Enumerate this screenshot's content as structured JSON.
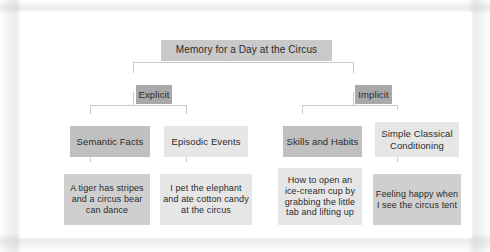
{
  "diagram": {
    "title": "Memory for a Day at the Circus",
    "type": "hierarchy-tree",
    "levels": 4,
    "colors": {
      "root_fill": "#c9c9c9",
      "branch_fill": "#a9a9a9",
      "dark_fill": "#c0c0c0",
      "light_fill": "#e6e6e6",
      "mid_fill": "#cfcfcf",
      "connector": "#c9c9c9",
      "text": "#2b2b2b",
      "panel_background": "#ffffff"
    },
    "nodes": {
      "root": {
        "label": "Memory for a Day at the Circus"
      },
      "explicit": {
        "label": "Explicit"
      },
      "implicit": {
        "label": "Implicit"
      },
      "semantic_facts": {
        "label": "Semantic Facts"
      },
      "episodic_events": {
        "label": "Episodic Events"
      },
      "skills_and_habits": {
        "label": "Skills and Habits"
      },
      "simple_classical_conditioning": {
        "label": "Simple Classical\nConditioning"
      },
      "semantic_facts_example": {
        "label": "A tiger has stripes\nand a circus bear\ncan dance"
      },
      "episodic_events_example": {
        "label": "I pet the elephant\nand ate cotton candy\nat the circus"
      },
      "skills_and_habits_example": {
        "label": "How to open an\nice-cream cup by\ngrabbing the little\ntab and lifting up"
      },
      "simple_classical_conditioning_example": {
        "label": "Feeling happy when\nI see the circus tent"
      }
    }
  }
}
